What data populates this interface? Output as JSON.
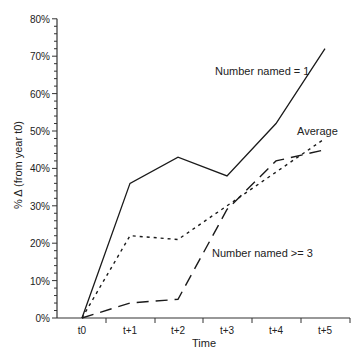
{
  "chart_data": {
    "type": "line",
    "title": "",
    "xlabel": "Time",
    "ylabel": "% Δ (from year t0)",
    "categories": [
      "t0",
      "t+1",
      "t+2",
      "t+3",
      "t+4",
      "t+5"
    ],
    "ylim": [
      0,
      80
    ],
    "yticks": [
      "0%",
      "10%",
      "20%",
      "30%",
      "40%",
      "50%",
      "60%",
      "70%",
      "80%"
    ],
    "grid": false,
    "series": [
      {
        "name": "Number named = 1",
        "style": "solid",
        "values": [
          0,
          36,
          43,
          38,
          52,
          72
        ]
      },
      {
        "name": "Average",
        "style": "dotted",
        "values": [
          0,
          22,
          21,
          30,
          39,
          48
        ]
      },
      {
        "name": "Number named >= 3",
        "style": "dashed",
        "values": [
          0,
          4,
          5,
          29,
          42,
          45
        ]
      }
    ],
    "annotations": [
      {
        "text": "Number named = 1",
        "series": 0
      },
      {
        "text": "Average",
        "series": 1
      },
      {
        "text": "Number named >= 3",
        "series": 2
      }
    ]
  },
  "colors": {
    "line": "#1a1a1a",
    "axis": "#333333",
    "background": "#ffffff"
  }
}
